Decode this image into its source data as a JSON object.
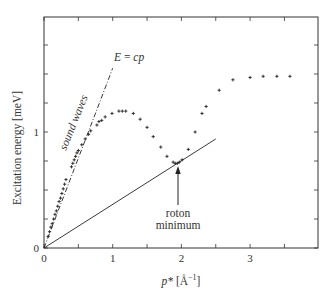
{
  "chart_data": {
    "type": "scatter",
    "title": "",
    "xlabel": "p* [Å⁻¹]",
    "xlabel_parts": {
      "var": "p*",
      "unit": "[Å",
      "exp": "−1",
      "close": "]"
    },
    "ylabel": "Excitation energy [meV]",
    "xlim": [
      0,
      4
    ],
    "ylim": [
      0,
      2
    ],
    "x_ticks": [
      0,
      1,
      2,
      3
    ],
    "x_minor_ticks": [
      0.5,
      1.5,
      2.5,
      3.5
    ],
    "y_ticks_labeled": [
      0,
      1
    ],
    "y_ticks": [
      0,
      0.25,
      0.5,
      0.75,
      1,
      1.25,
      1.5,
      1.75
    ],
    "grid": false,
    "legend": null,
    "series": [
      {
        "name": "measured dispersion",
        "marker": "+",
        "points": [
          [
            0.06,
            0.1
          ],
          [
            0.08,
            0.14
          ],
          [
            0.1,
            0.18
          ],
          [
            0.12,
            0.21
          ],
          [
            0.14,
            0.25
          ],
          [
            0.16,
            0.29
          ],
          [
            0.18,
            0.32
          ],
          [
            0.2,
            0.36
          ],
          [
            0.22,
            0.4
          ],
          [
            0.24,
            0.43
          ],
          [
            0.26,
            0.47
          ],
          [
            0.28,
            0.51
          ],
          [
            0.3,
            0.55
          ],
          [
            0.32,
            0.59
          ],
          [
            0.4,
            0.7
          ],
          [
            0.42,
            0.73
          ],
          [
            0.44,
            0.76
          ],
          [
            0.46,
            0.79
          ],
          [
            0.48,
            0.82
          ],
          [
            0.5,
            0.84
          ],
          [
            0.55,
            0.89
          ],
          [
            0.6,
            0.94
          ],
          [
            0.65,
            0.98
          ],
          [
            0.68,
            1.01
          ],
          [
            0.77,
            1.06
          ],
          [
            0.8,
            1.09
          ],
          [
            0.84,
            1.1
          ],
          [
            0.89,
            1.13
          ],
          [
            0.99,
            1.16
          ],
          [
            1.09,
            1.18
          ],
          [
            1.14,
            1.18
          ],
          [
            1.19,
            1.18
          ],
          [
            1.3,
            1.16
          ],
          [
            1.4,
            1.11
          ],
          [
            1.5,
            1.04
          ],
          [
            1.59,
            0.96
          ],
          [
            1.7,
            0.87
          ],
          [
            1.79,
            0.79
          ],
          [
            1.88,
            0.74
          ],
          [
            1.91,
            0.73
          ],
          [
            1.94,
            0.73
          ],
          [
            1.97,
            0.74
          ],
          [
            2.01,
            0.76
          ],
          [
            2.1,
            0.85
          ],
          [
            2.2,
            1.0
          ],
          [
            2.3,
            1.16
          ],
          [
            2.36,
            1.22
          ],
          [
            2.55,
            1.36
          ],
          [
            2.75,
            1.45
          ],
          [
            3.0,
            1.47
          ],
          [
            3.19,
            1.48
          ],
          [
            3.39,
            1.48
          ],
          [
            3.58,
            1.48
          ]
        ]
      },
      {
        "name": "E = cp",
        "style": "dash-dot",
        "points": [
          [
            0,
            0
          ],
          [
            1.0,
            1.55
          ]
        ]
      },
      {
        "name": "Landau critical line",
        "style": "solid",
        "points": [
          [
            0,
            0
          ],
          [
            2.5,
            0.94
          ]
        ]
      }
    ],
    "annotations": [
      {
        "text": "E = cp",
        "x": 1.12,
        "y": 1.6,
        "italic": true
      },
      {
        "text": "sound waves",
        "x": 0.45,
        "y": 0.95,
        "rotation": -68
      },
      {
        "text": "roton",
        "x": 1.95,
        "y": 0.28
      },
      {
        "text": "minimum",
        "x": 1.95,
        "y": 0.18
      },
      {
        "arrow_from": [
          1.95,
          0.37
        ],
        "arrow_to": [
          1.95,
          0.69
        ]
      }
    ]
  },
  "labels": {
    "ylabel": "Excitation energy [meV]",
    "x_var": "p*",
    "x_unit_open": " [Å",
    "x_unit_exp": "−1",
    "x_unit_close": "]",
    "tick_x0": "0",
    "tick_x1": "1",
    "tick_x2": "2",
    "tick_x3": "3",
    "tick_y0": "0",
    "tick_y1": "1",
    "ecp_E": "E",
    "ecp_eq": " = ",
    "ecp_cp": "cp",
    "sound_waves": "sound waves",
    "roton": "roton",
    "minimum": "minimum"
  }
}
